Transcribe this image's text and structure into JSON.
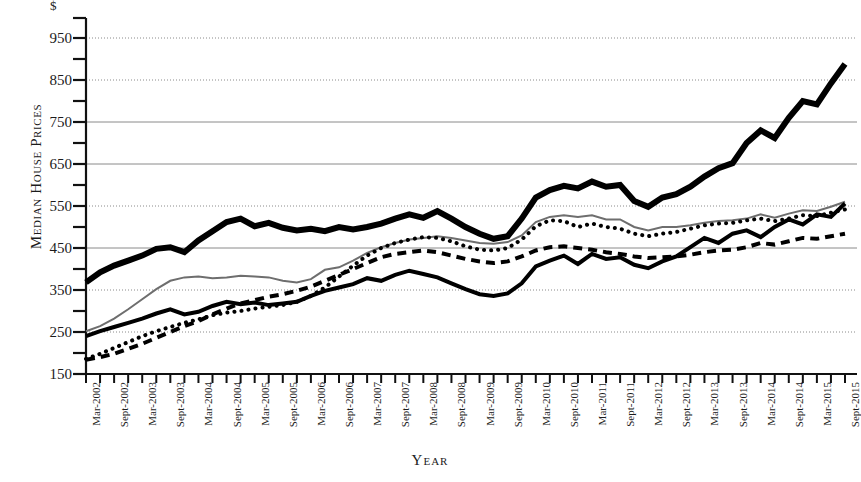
{
  "chart_data": {
    "type": "line",
    "title": "",
    "xlabel": "Year",
    "ylabel": "Median House Prices",
    "currency_symbol": "$",
    "ylim": [
      150,
      1000
    ],
    "ytick_values": [
      150,
      250,
      350,
      450,
      550,
      650,
      750,
      850,
      950
    ],
    "ytick_labels": [
      "150",
      "250",
      "350",
      "450",
      "550",
      "650",
      "750",
      "850",
      "950"
    ],
    "minor_ticks": true,
    "grid": "horizontal-dotted",
    "legend": "none",
    "x_tick_count": 56,
    "categories": [
      "Mar-2002",
      "Jun-2002",
      "Sept-2002",
      "Dec-2002",
      "Mar-2003",
      "Jun-2003",
      "Sept-2003",
      "Dec-2003",
      "Mar-2004",
      "Jun-2004",
      "Sept-2004",
      "Dec-2004",
      "Mar-2005",
      "Jun-2005",
      "Sept-2005",
      "Dec-2005",
      "Mar-2006",
      "Jun-2006",
      "Sept-2006",
      "Dec-2006",
      "Mar-2007",
      "Jun-2007",
      "Sept-2007",
      "Dec-2007",
      "Mar-2008",
      "Jun-2008",
      "Sept-2008",
      "Dec-2008",
      "Mar-2009",
      "Jun-2009",
      "Sept-2009",
      "Dec-2009",
      "Mar-2010",
      "Jun-2010",
      "Sept-2010",
      "Dec-2010",
      "Mar-2011",
      "Jun-2011",
      "Sept-2011",
      "Dec-2011",
      "Mar-2012",
      "Jun-2012",
      "Sept-2012",
      "Dec-2012",
      "Mar-2013",
      "Jun-2013",
      "Sept-2013",
      "Dec-2013",
      "Mar-2014",
      "Jun-2014",
      "Sept-2014",
      "Dec-2014",
      "Mar-2015",
      "Jun-2015",
      "Sept-2015"
    ],
    "visible_xtick_labels": [
      "Mar-2002",
      "Sept-2002",
      "Mar-2003",
      "Sept-2003",
      "Mar-2004",
      "Sept-2004",
      "Mar-2005",
      "Sept-2005",
      "Mar-2006",
      "Sept-2006",
      "Mar-2007",
      "Sept-2007",
      "Mar-2008",
      "Sept-2008",
      "Mar-2009",
      "Sept-2009",
      "Mar-2010",
      "Sept-2010",
      "Mar-2011",
      "Sept-2011",
      "Mar-2012",
      "Sept-2012",
      "Mar-2013",
      "Sept-2013",
      "Mar-2014",
      "Sept-2014",
      "Mar-2015",
      "Sept-2015"
    ],
    "series": [
      {
        "name": "series-thick-black",
        "style": "solid-thick",
        "color": "#000000",
        "width": 6,
        "values": [
          368,
          392,
          408,
          420,
          432,
          448,
          452,
          440,
          468,
          490,
          512,
          520,
          502,
          510,
          498,
          492,
          496,
          490,
          500,
          494,
          500,
          508,
          520,
          530,
          522,
          538,
          520,
          500,
          484,
          472,
          478,
          520,
          570,
          588,
          598,
          592,
          608,
          596,
          600,
          562,
          548,
          570,
          578,
          596,
          620,
          640,
          652,
          700,
          730,
          712,
          760,
          800,
          792,
          842,
          888
        ]
      },
      {
        "name": "series-gray-thin",
        "style": "solid-thin",
        "color": "#6e6e6e",
        "width": 2,
        "values": [
          252,
          264,
          282,
          304,
          328,
          352,
          372,
          380,
          382,
          378,
          380,
          384,
          382,
          380,
          372,
          368,
          376,
          398,
          404,
          420,
          438,
          452,
          462,
          470,
          474,
          478,
          474,
          468,
          462,
          460,
          464,
          480,
          512,
          524,
          528,
          524,
          528,
          518,
          518,
          500,
          492,
          500,
          500,
          504,
          510,
          514,
          516,
          520,
          530,
          522,
          532,
          540,
          538,
          548,
          560
        ]
      },
      {
        "name": "series-dotted-black",
        "style": "dotted",
        "color": "#000000",
        "width": 4,
        "values": [
          186,
          198,
          212,
          226,
          240,
          252,
          262,
          272,
          280,
          290,
          296,
          300,
          306,
          310,
          314,
          322,
          336,
          356,
          382,
          408,
          432,
          450,
          462,
          470,
          476,
          474,
          466,
          454,
          446,
          444,
          450,
          470,
          502,
          516,
          514,
          500,
          508,
          500,
          496,
          484,
          478,
          484,
          488,
          496,
          504,
          508,
          510,
          516,
          520,
          514,
          520,
          528,
          526,
          534,
          542
        ]
      },
      {
        "name": "series-dashed-black",
        "style": "dashed",
        "color": "#000000",
        "width": 4,
        "values": [
          184,
          190,
          198,
          210,
          222,
          236,
          250,
          264,
          276,
          292,
          306,
          318,
          326,
          334,
          340,
          348,
          358,
          372,
          386,
          400,
          414,
          428,
          436,
          440,
          444,
          440,
          432,
          424,
          418,
          414,
          418,
          430,
          444,
          452,
          454,
          450,
          446,
          440,
          436,
          430,
          426,
          428,
          430,
          434,
          440,
          444,
          446,
          452,
          462,
          458,
          466,
          474,
          472,
          478,
          484
        ]
      },
      {
        "name": "series-medium-black",
        "style": "solid-medium",
        "color": "#000000",
        "width": 4,
        "values": [
          240,
          252,
          262,
          272,
          282,
          294,
          304,
          292,
          298,
          312,
          322,
          316,
          320,
          314,
          318,
          322,
          336,
          348,
          356,
          364,
          378,
          372,
          386,
          396,
          388,
          380,
          366,
          352,
          340,
          336,
          342,
          366,
          406,
          420,
          432,
          412,
          436,
          424,
          428,
          410,
          402,
          418,
          430,
          452,
          474,
          462,
          484,
          492,
          476,
          500,
          518,
          506,
          530,
          524,
          556
        ]
      }
    ]
  }
}
